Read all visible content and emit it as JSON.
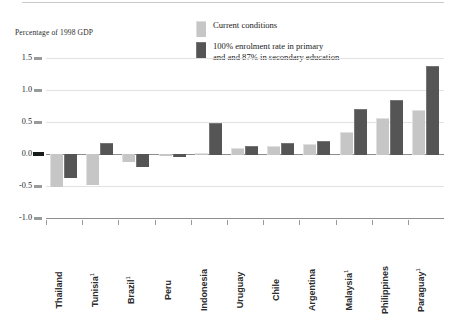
{
  "chart_data": {
    "type": "bar",
    "title": "",
    "ylabel": "Percentage of 1998 GDP",
    "xlabel": "",
    "ylim": [
      -1.0,
      1.5
    ],
    "yticks": [
      "1.5",
      "1.0",
      "0.5",
      "0.0",
      "-0.5",
      "-1.0"
    ],
    "ytick_values": [
      1.5,
      1.0,
      0.5,
      0.0,
      -0.5,
      -1.0
    ],
    "grid": true,
    "legend_position": "top-center",
    "categories": [
      "Thailand",
      "Tunisia",
      "Brazil",
      "Peru",
      "Indonesia",
      "Uruguay",
      "Chile",
      "Argentina",
      "Malaysia",
      "Philippines",
      "Paraguay"
    ],
    "category_footnotes": [
      "",
      "1",
      "1",
      "",
      "",
      "",
      "",
      "",
      "1",
      "",
      "1"
    ],
    "series": [
      {
        "name": "Current conditions",
        "color": "#c6c6c6",
        "values": [
          -0.52,
          -0.48,
          -0.13,
          -0.03,
          0.02,
          0.1,
          0.13,
          0.15,
          0.35,
          0.57,
          0.68
        ]
      },
      {
        "name": "100% enrolment rate in primary\nand and 87% in secondary education",
        "color": "#555555",
        "values": [
          -0.37,
          0.17,
          -0.2,
          -0.04,
          0.49,
          0.12,
          0.17,
          0.2,
          0.7,
          0.85,
          1.37
        ]
      }
    ]
  },
  "legend": {
    "items": [
      {
        "label": "Current conditions",
        "swatch": "light"
      },
      {
        "label": "100% enrolment rate in primary\nand and 87% in secondary education",
        "swatch": "dark"
      }
    ]
  },
  "axis": {
    "y_title": "Percentage of 1998 GDP"
  }
}
